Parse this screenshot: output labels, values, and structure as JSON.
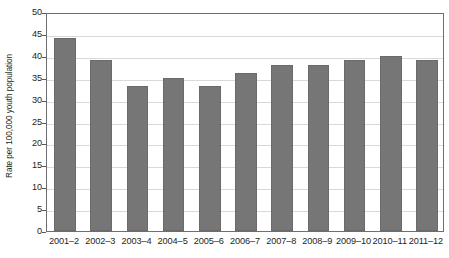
{
  "chart_data": {
    "type": "bar",
    "title": "",
    "subtitle": "",
    "xlabel": "",
    "ylabel": "Rate per 100,000 youth population",
    "ylim": [
      0,
      50
    ],
    "ytick_interval": 5,
    "yticks": [
      "50",
      "45",
      "40",
      "35",
      "30",
      "25",
      "20",
      "15",
      "10",
      "5",
      "0"
    ],
    "ytick_values": [
      50,
      45,
      40,
      35,
      30,
      25,
      20,
      15,
      10,
      5,
      0
    ],
    "grid": "horizontal",
    "legend": "none",
    "categories": [
      "2001–2",
      "2002–3",
      "2003–4",
      "2004–5",
      "2005–6",
      "2006–7",
      "2007–8",
      "2008–9",
      "2009–10",
      "2010–11",
      "2011–12"
    ],
    "values": [
      44,
      39,
      33,
      35,
      33,
      36,
      38,
      38,
      39,
      40,
      39
    ],
    "series": [
      {
        "name": "Rate per 100,000 youth population",
        "values": [
          44,
          39,
          33,
          35,
          33,
          36,
          38,
          38,
          39,
          40,
          39
        ],
        "color": "#767676"
      }
    ],
    "colors": {
      "bar_fill": "#767676",
      "bar_stroke": "#6a6a6a",
      "gridline": "#d8d9da",
      "axis": "#6d6e71",
      "text": "#231f20",
      "background": "#ffffff"
    }
  }
}
